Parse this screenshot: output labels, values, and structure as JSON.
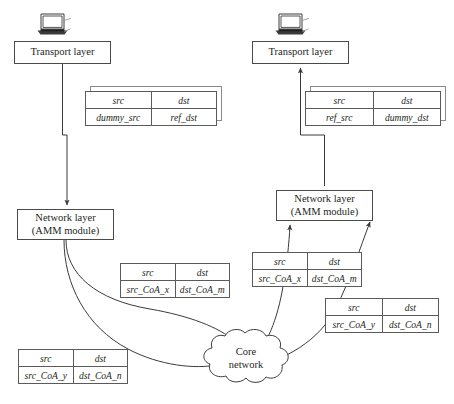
{
  "diagram": {
    "type": "network-flow-diagram",
    "background_color": "#ffffff",
    "line_color": "#3b3b3b",
    "text_color": "#231f20"
  },
  "devices": [
    {
      "id": "laptop-left",
      "icon": "laptop-icon",
      "x": 38,
      "y": 12
    },
    {
      "id": "laptop-right",
      "icon": "laptop-icon",
      "x": 276,
      "y": 12
    }
  ],
  "nodes": [
    {
      "id": "transport-layer-left",
      "label": "Transport layer",
      "lines": [
        "Transport layer"
      ],
      "x": 14,
      "y": 41,
      "w": 97,
      "h": 23
    },
    {
      "id": "transport-layer-right",
      "label": "Transport layer",
      "lines": [
        "Transport layer"
      ],
      "x": 252,
      "y": 41,
      "w": 97,
      "h": 23
    },
    {
      "id": "network-layer-left",
      "label": "Network layer (AMM module)",
      "lines": [
        "Network layer",
        "(AMM module)"
      ],
      "x": 17,
      "y": 209,
      "w": 97,
      "h": 31
    },
    {
      "id": "network-layer-right",
      "label": "Network layer (AMM module)",
      "lines": [
        "Network layer",
        "(AMM module)"
      ],
      "x": 276,
      "y": 190,
      "w": 97,
      "h": 31
    },
    {
      "id": "core-network-cloud",
      "label": "Core network",
      "lines": [
        "Core",
        "network"
      ],
      "x": 196,
      "y": 341
    }
  ],
  "packet_tables": [
    {
      "id": "packet-dummy-src-ref-dst",
      "stacked": true,
      "x": 85,
      "y": 91,
      "w": 132,
      "headers": [
        "src",
        "dst"
      ],
      "values": [
        "dummy_src",
        "ref_dst"
      ]
    },
    {
      "id": "packet-ref-src-dummy-dst",
      "stacked": true,
      "x": 305,
      "y": 91,
      "w": 136,
      "headers": [
        "src",
        "dst"
      ],
      "values": [
        "ref_src",
        "dummy_dst"
      ]
    },
    {
      "id": "packet-src-coa-x-dst-coa-m-left",
      "stacked": false,
      "x": 120,
      "y": 263,
      "w": 110,
      "headers": [
        "src",
        "dst"
      ],
      "values": [
        "src_CoA_x",
        "dst_CoA_m"
      ]
    },
    {
      "id": "packet-src-coa-y-dst-coa-n-left",
      "stacked": false,
      "x": 18,
      "y": 349,
      "w": 110,
      "headers": [
        "src",
        "dst"
      ],
      "values": [
        "src_CoA_y",
        "dst_CoA_n"
      ]
    },
    {
      "id": "packet-src-coa-x-dst-coa-m-right",
      "stacked": false,
      "x": 252,
      "y": 252,
      "w": 110,
      "headers": [
        "src",
        "dst"
      ],
      "values": [
        "src_CoA_x",
        "dst_CoA_m"
      ]
    },
    {
      "id": "packet-src-coa-y-dst-coa-n-right",
      "stacked": false,
      "x": 325,
      "y": 298,
      "w": 114,
      "headers": [
        "src",
        "dst"
      ],
      "values": [
        "src_CoA_y",
        "dst_CoA_n"
      ]
    }
  ],
  "connectors": [
    {
      "id": "left-transport-to-network",
      "kind": "orthogonal-arrow",
      "direction": "down"
    },
    {
      "id": "right-network-to-transport",
      "kind": "orthogonal-arrow",
      "direction": "up"
    },
    {
      "id": "left-network-to-cloud-upper",
      "kind": "curved-arrow",
      "direction": "to-cloud"
    },
    {
      "id": "left-network-to-cloud-lower",
      "kind": "curved-arrow",
      "direction": "to-cloud"
    },
    {
      "id": "cloud-to-right-network-lower",
      "kind": "curved-arrow",
      "direction": "to-network-layer"
    },
    {
      "id": "cloud-to-right-network-upper",
      "kind": "curved-arrow",
      "direction": "to-network-layer"
    }
  ]
}
